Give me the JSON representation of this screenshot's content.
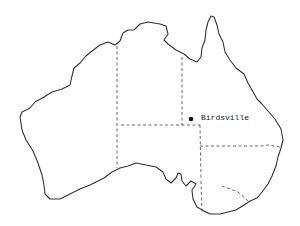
{
  "map": {
    "title": "",
    "region": "Australia",
    "marker": {
      "label": "Birdsville",
      "color": "#111111"
    },
    "colors": {
      "coastline": "#333333",
      "borders": "#444444",
      "background": "#ffffff"
    }
  }
}
